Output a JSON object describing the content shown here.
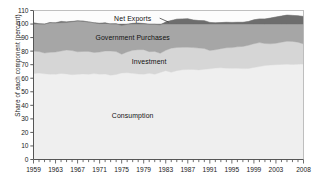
{
  "chart_data": {
    "type": "area",
    "stacked": true,
    "title": "",
    "subtitle": "",
    "xlabel": "",
    "ylabel": "Share of each component (percent)",
    "xlim": [
      1959,
      2008
    ],
    "ylim": [
      0,
      110
    ],
    "ytick_labels": [
      "0",
      "10",
      "20",
      "30",
      "40",
      "50",
      "60",
      "70",
      "80",
      "90",
      "100",
      "110"
    ],
    "ytick_values": [
      0,
      10,
      20,
      30,
      40,
      50,
      60,
      70,
      80,
      90,
      100,
      110
    ],
    "xtick_labels": [
      "1959",
      "1963",
      "1967",
      "1971",
      "1975",
      "1979",
      "1983",
      "1987",
      "1991",
      "1995",
      "1999",
      "2003",
      "2008"
    ],
    "xtick_values": [
      1959,
      1963,
      1967,
      1971,
      1975,
      1979,
      1983,
      1987,
      1991,
      1995,
      1999,
      2003,
      2008
    ],
    "minor_ticks": true,
    "grid": false,
    "legend_position": "inline-annotations",
    "annotations": [
      {
        "text": "Net Exports",
        "x": 1977,
        "y": 104,
        "leader": true
      },
      {
        "text": "Government Purchases",
        "x": 1977,
        "y": 90
      },
      {
        "text": "Investment",
        "x": 1980,
        "y": 72
      },
      {
        "text": "Consumption",
        "x": 1977,
        "y": 32
      }
    ],
    "colors": {
      "consumption": "#efefef",
      "investment": "#d6d6d6",
      "government": "#a6a6a6",
      "net_exports": "#6d6d6d",
      "axis": "#4a4a4a",
      "text": "#1a1a1a",
      "plot_background": "#fcfcfc"
    },
    "x": [
      1959,
      1960,
      1961,
      1962,
      1963,
      1964,
      1965,
      1966,
      1967,
      1968,
      1969,
      1970,
      1971,
      1972,
      1973,
      1974,
      1975,
      1976,
      1977,
      1978,
      1979,
      1980,
      1981,
      1982,
      1983,
      1984,
      1985,
      1986,
      1987,
      1988,
      1989,
      1990,
      1991,
      1992,
      1993,
      1994,
      1995,
      1996,
      1997,
      1998,
      1999,
      2000,
      2001,
      2002,
      2003,
      2004,
      2005,
      2006,
      2007,
      2008
    ],
    "series": [
      {
        "name": "Consumption",
        "key": "consumption",
        "color": "#efefef",
        "values": [
          63.4,
          63.8,
          63.3,
          62.9,
          62.9,
          63.5,
          63.2,
          62.6,
          62.9,
          63.2,
          62.9,
          63.4,
          63.0,
          63.1,
          62.2,
          62.8,
          63.9,
          64.0,
          63.6,
          63.1,
          63.0,
          63.6,
          62.9,
          64.3,
          65.6,
          64.4,
          65.6,
          66.2,
          66.4,
          66.5,
          66.1,
          66.6,
          67.0,
          67.5,
          67.7,
          67.4,
          67.3,
          67.4,
          67.1,
          67.2,
          68.0,
          68.6,
          69.4,
          69.7,
          70.0,
          70.2,
          70.4,
          70.1,
          70.4,
          70.5
        ]
      },
      {
        "name": "Investment",
        "key": "investment",
        "color": "#d6d6d6",
        "values": [
          16.6,
          15.9,
          15.3,
          16.2,
          16.4,
          16.6,
          17.6,
          17.8,
          16.6,
          16.6,
          16.9,
          15.6,
          16.3,
          17.0,
          17.9,
          16.9,
          13.8,
          15.4,
          17.0,
          18.0,
          18.1,
          16.0,
          16.9,
          14.1,
          15.0,
          17.8,
          17.1,
          16.6,
          16.5,
          16.1,
          16.2,
          15.3,
          13.5,
          13.5,
          14.1,
          15.1,
          15.3,
          15.8,
          16.4,
          17.1,
          17.5,
          17.7,
          16.2,
          15.7,
          15.8,
          16.4,
          16.9,
          17.1,
          16.2,
          14.8
        ]
      },
      {
        "name": "Government Purchases",
        "key": "government",
        "color": "#a6a6a6",
        "values": [
          21.0,
          20.5,
          21.4,
          22.0,
          21.5,
          20.9,
          20.3,
          21.3,
          22.7,
          22.4,
          21.8,
          21.9,
          21.3,
          20.8,
          19.9,
          20.5,
          21.2,
          20.4,
          19.9,
          19.6,
          19.3,
          20.2,
          20.0,
          21.0,
          20.9,
          20.4,
          20.9,
          21.0,
          21.0,
          20.4,
          20.3,
          20.6,
          20.7,
          19.9,
          19.3,
          18.8,
          18.6,
          18.1,
          17.8,
          17.6,
          17.6,
          17.5,
          18.2,
          19.0,
          19.4,
          19.3,
          19.3,
          19.2,
          19.5,
          20.3
        ]
      },
      {
        "name": "Net Exports",
        "key": "net_exports",
        "color": "#6d6d6d",
        "values": [
          -1.0,
          -0.2,
          0.0,
          -0.1,
          0.2,
          1.0,
          0.6,
          0.3,
          0.2,
          -0.2,
          -0.1,
          0.1,
          -0.3,
          -0.5,
          0.3,
          -0.2,
          1.1,
          0.2,
          -0.5,
          -0.7,
          -0.4,
          0.2,
          0.2,
          0.6,
          -1.5,
          -2.6,
          -3.6,
          -3.8,
          -3.9,
          -3.0,
          -2.6,
          -2.5,
          -1.2,
          -0.9,
          -1.1,
          -1.3,
          -1.2,
          -1.3,
          -1.3,
          -1.9,
          -3.1,
          -3.8,
          -3.8,
          -4.4,
          -5.2,
          -5.9,
          -6.6,
          -6.4,
          -6.1,
          -5.6
        ]
      }
    ]
  }
}
